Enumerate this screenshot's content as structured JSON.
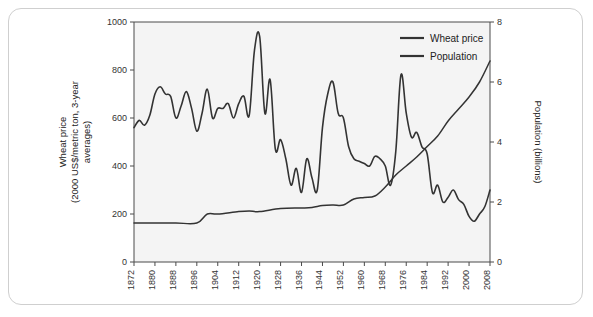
{
  "figure": {
    "frame_border_color": "#cfcfcf",
    "plot_bg_color": "#f4f4f4",
    "line_color": "#333333",
    "axis_color": "#4a4a4a"
  },
  "legend": {
    "position": "top-right",
    "entries": [
      {
        "label": "Wheat price",
        "color": "#333333"
      },
      {
        "label": "Population",
        "color": "#333333"
      }
    ]
  },
  "chart_data": {
    "type": "line",
    "title": "",
    "subtitle": "",
    "xlabel": "",
    "ylabel": "Wheat price (2000 US$/metric ton, 3-year averages)",
    "ylabel_line1": "Wheat price",
    "ylabel_line2": "(2000 US$/metric ton, 3-year",
    "ylabel_line3": "averages)",
    "y2label": "Population (billions)",
    "grid": false,
    "xlim": [
      1872,
      2008
    ],
    "ylim": [
      0,
      1000
    ],
    "y2lim": [
      0,
      8
    ],
    "yticks": [
      0,
      200,
      400,
      600,
      800,
      1000
    ],
    "ytick_labels": [
      "0",
      "200",
      "400",
      "600",
      "800",
      "1000"
    ],
    "y2ticks": [
      0,
      2,
      4,
      6,
      8
    ],
    "y2tick_labels": [
      "0",
      "2",
      "4",
      "6",
      "8"
    ],
    "xticks": [
      1872,
      1880,
      1888,
      1896,
      1904,
      1912,
      1920,
      1928,
      1936,
      1944,
      1952,
      1960,
      1968,
      1976,
      1984,
      1992,
      2000,
      2008
    ],
    "xtick_labels": [
      "1872",
      "1880",
      "1888",
      "1896",
      "1904",
      "1912",
      "1920",
      "1928",
      "1936",
      "1944",
      "1952",
      "1960",
      "1968",
      "1976",
      "1984",
      "1992",
      "2000",
      "2008"
    ],
    "series": [
      {
        "name": "Wheat price",
        "axis": "left",
        "units": "2000 US$/metric ton",
        "x": [
          1872,
          1874,
          1876,
          1878,
          1880,
          1882,
          1884,
          1886,
          1888,
          1890,
          1892,
          1894,
          1896,
          1898,
          1900,
          1902,
          1904,
          1906,
          1908,
          1910,
          1912,
          1914,
          1916,
          1918,
          1920,
          1922,
          1924,
          1926,
          1928,
          1930,
          1932,
          1934,
          1936,
          1938,
          1940,
          1942,
          1944,
          1946,
          1948,
          1950,
          1952,
          1954,
          1956,
          1958,
          1960,
          1962,
          1964,
          1966,
          1968,
          1970,
          1972,
          1974,
          1976,
          1978,
          1980,
          1982,
          1984,
          1986,
          1988,
          1990,
          1992,
          1994,
          1996,
          1998,
          2000,
          2002,
          2004,
          2006,
          2008
        ],
        "y": [
          560,
          590,
          570,
          610,
          700,
          730,
          700,
          690,
          600,
          650,
          710,
          640,
          545,
          620,
          720,
          600,
          640,
          640,
          660,
          600,
          660,
          690,
          610,
          880,
          940,
          620,
          760,
          470,
          510,
          430,
          320,
          390,
          290,
          430,
          350,
          300,
          560,
          700,
          750,
          620,
          600,
          480,
          430,
          420,
          410,
          400,
          440,
          430,
          400,
          320,
          460,
          780,
          620,
          520,
          540,
          480,
          450,
          290,
          320,
          250,
          270,
          300,
          260,
          240,
          190,
          170,
          200,
          230,
          300
        ],
        "color": "#333333"
      },
      {
        "name": "Population",
        "axis": "right",
        "units": "billions",
        "x": [
          1872,
          1880,
          1888,
          1896,
          1900,
          1904,
          1912,
          1916,
          1920,
          1928,
          1936,
          1940,
          1944,
          1948,
          1952,
          1956,
          1960,
          1964,
          1968,
          1972,
          1976,
          1980,
          1984,
          1988,
          1992,
          1996,
          2000,
          2004,
          2008
        ],
        "y": [
          1.3,
          1.3,
          1.3,
          1.3,
          1.6,
          1.6,
          1.68,
          1.7,
          1.68,
          1.78,
          1.8,
          1.82,
          1.88,
          1.9,
          1.9,
          2.1,
          2.15,
          2.2,
          2.5,
          2.9,
          3.2,
          3.5,
          3.85,
          4.2,
          4.7,
          5.1,
          5.5,
          6.0,
          6.7
        ],
        "color": "#333333"
      }
    ]
  }
}
